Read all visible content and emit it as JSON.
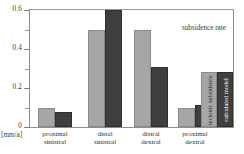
{
  "chart_data": {
    "type": "bar",
    "title": "",
    "annotation": "subsidence rate",
    "xlabel": "",
    "ylabel": "[mm/a]",
    "ylim": [
      0,
      0.6
    ],
    "grid": false,
    "legend_position": "inside-right",
    "y_ticks_major": [
      "0",
      "0.2",
      "0.4",
      "0.6"
    ],
    "y_ticks_major_values": [
      0,
      0.2,
      0.4,
      0.6
    ],
    "y_ticks_minor_values": [
      0.1,
      0.3,
      0.5
    ],
    "categories": [
      "proximal\nsinistral",
      "distal\nsinistral",
      "distral\ndextral",
      "proximal\ndextral"
    ],
    "category_lines": [
      [
        "proximal",
        "sinistral"
      ],
      [
        "distal",
        "sinistral"
      ],
      [
        "distral",
        "dextral"
      ],
      [
        "proximal",
        "dextral"
      ]
    ],
    "series": [
      {
        "name": "tectonic subsidence",
        "color": "#a6a6a6",
        "values": [
          0.1,
          0.5,
          0.5,
          0.1
        ]
      },
      {
        "name": "calculated model",
        "color": "#3f3f3f",
        "values": [
          0.075,
          0.6,
          0.31,
          0.115
        ]
      }
    ]
  },
  "axis": {
    "unit_label": "[mm/a]"
  },
  "legend": {
    "items": [
      {
        "label": "tectonic subsidence",
        "color": "#a6a6a6"
      },
      {
        "label": "calculated model",
        "color": "#3f3f3f"
      }
    ]
  }
}
